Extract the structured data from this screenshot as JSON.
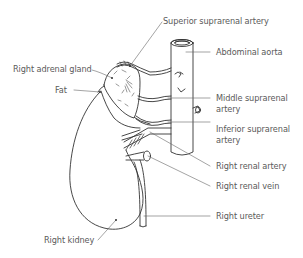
{
  "diagram": {
    "line_color": "#333333",
    "label_color": "#5a5a5a",
    "labels": {
      "superior_suprarenal_artery": "Superior suprarenal artery",
      "abdominal_aorta": "Abdominal aorta",
      "right_adrenal_gland": "Right adrenal gland",
      "fat": "Fat",
      "middle_suprarenal_artery_line1": "Middle suprarenal",
      "middle_suprarenal_artery_line2": "artery",
      "inferior_suprarenal_artery_line1": "Inferior suprarenal",
      "inferior_suprarenal_artery_line2": "artery",
      "right_renal_artery": "Right renal artery",
      "right_renal_vein": "Right renal vein",
      "right_ureter": "Right ureter",
      "right_kidney": "Right kidney"
    }
  }
}
